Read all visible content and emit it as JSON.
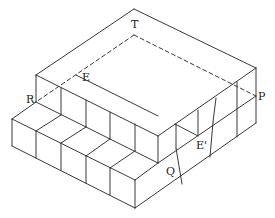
{
  "figure": {
    "labels": {
      "T": "T",
      "E": "E",
      "R": "R",
      "P": "P",
      "E_prime": "E'",
      "Q": "Q"
    },
    "line_color": "#222222",
    "background": "#ffffff"
  }
}
